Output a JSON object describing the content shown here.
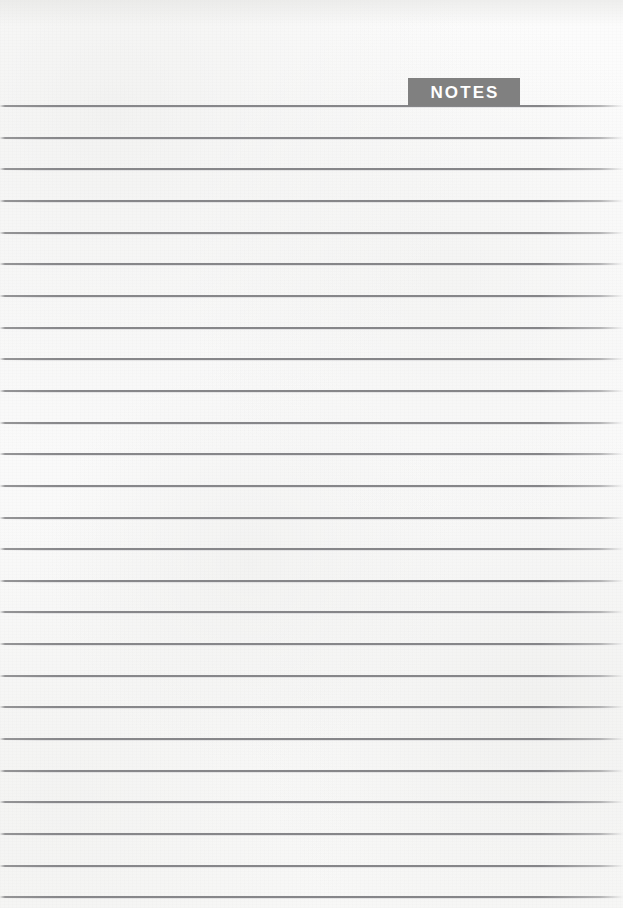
{
  "page": {
    "width": 623,
    "height": 908,
    "background_color": "#fbfbfa",
    "kind": "lined-notes-page"
  },
  "banner": {
    "label": "NOTES",
    "background_color": "#808080",
    "text_color": "#ffffff",
    "x": 408,
    "y": 78,
    "width": 112,
    "height": 28
  },
  "rules": {
    "color": "#858588",
    "count": 26,
    "first_y": 105,
    "spacing": 31.65,
    "left_x": 0,
    "right_x": 623,
    "positions": [
      105,
      136.7,
      168.3,
      200,
      231.6,
      263.3,
      294.9,
      326.6,
      358.2,
      389.9,
      421.5,
      453.2,
      484.8,
      516.5,
      548.1,
      579.8,
      611.4,
      643.1,
      674.7,
      706.4,
      738,
      769.7,
      801.3,
      833,
      864.6,
      896.3
    ]
  }
}
